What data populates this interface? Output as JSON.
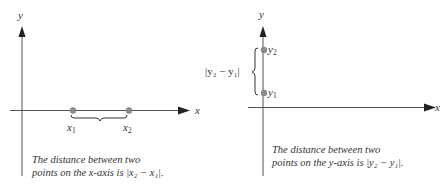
{
  "left_diagram": {
    "y_axis_label": "y",
    "x_axis_label": "x",
    "point_1_label": "x",
    "point_1_sub": "1",
    "point_2_label": "x",
    "point_2_sub": "2",
    "caption_line_1": "The distance between two",
    "caption_line_2_prefix": "points on the x-axis is ",
    "caption_formula": "|x₂ − x₁|."
  },
  "right_diagram": {
    "y_axis_label": "y",
    "x_axis_label": "x",
    "point_1_label": "y",
    "point_1_sub": "1",
    "point_2_label": "y",
    "point_2_sub": "2",
    "brace_label": "|y₂ − y₁|",
    "caption_line_1": "The distance between two",
    "caption_line_2_prefix": "points on the y-axis is ",
    "caption_formula": "|y₂ − y₁|."
  },
  "colors": {
    "axis": "#444444",
    "point": "#8a8a8a",
    "text": "#333333"
  }
}
